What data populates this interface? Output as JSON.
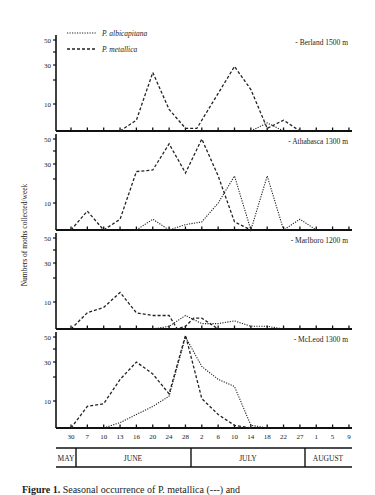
{
  "chart_data": {
    "type": "line",
    "ylabel": "Numbers of moths collected/week",
    "y_ticks": [
      10,
      30,
      50
    ],
    "y_minor_ticks": [
      20,
      40
    ],
    "ylim": [
      0,
      50
    ],
    "x_tick_labels": [
      "30",
      "7",
      "10",
      "13",
      "16",
      "20",
      "24",
      "28",
      "2",
      "6",
      "10",
      "14",
      "18",
      "22",
      "27",
      "1",
      "5",
      "9"
    ],
    "months": [
      {
        "label": "MAY",
        "start": 0,
        "end": 0.3
      },
      {
        "label": "JUNE",
        "start": 0.3,
        "end": 7.5
      },
      {
        "label": "JULY",
        "start": 7.5,
        "end": 14.5
      },
      {
        "label": "AUGUST",
        "start": 14.5,
        "end": 17.5
      }
    ],
    "legend": [
      {
        "name": "P. albicapitana",
        "style": "dotted"
      },
      {
        "name": "P. metallica",
        "style": "dashed"
      }
    ],
    "panels": [
      {
        "label": "- Berland 1500 m",
        "series": [
          {
            "name": "P. albicapitana",
            "points": [
              [
                11,
                0
              ],
              [
                12,
                3
              ],
              [
                13,
                0
              ]
            ]
          },
          {
            "name": "P. metallica",
            "points": [
              [
                3,
                0
              ],
              [
                4,
                4
              ],
              [
                5,
                25
              ],
              [
                6,
                8
              ],
              [
                7,
                1
              ],
              [
                7.7,
                1
              ],
              [
                10,
                29
              ],
              [
                11,
                16
              ],
              [
                12,
                1
              ],
              [
                13,
                4
              ],
              [
                14,
                0
              ]
            ]
          }
        ]
      },
      {
        "label": "- Athabasca 1300 m",
        "series": [
          {
            "name": "P. albicapitana",
            "points": [
              [
                4,
                0
              ],
              [
                5,
                4
              ],
              [
                6,
                0
              ],
              [
                7,
                2
              ],
              [
                8,
                3
              ],
              [
                9,
                10
              ],
              [
                10,
                22
              ],
              [
                11,
                0
              ],
              [
                12,
                22
              ],
              [
                13,
                0
              ],
              [
                14,
                4
              ],
              [
                15,
                0
              ]
            ]
          },
          {
            "name": "P. metallica",
            "points": [
              [
                0,
                0
              ],
              [
                1,
                7
              ],
              [
                2,
                0
              ],
              [
                3,
                4
              ],
              [
                4,
                25
              ],
              [
                5,
                26
              ],
              [
                6,
                46
              ],
              [
                7,
                24
              ],
              [
                8,
                50
              ],
              [
                9,
                22
              ],
              [
                10,
                3
              ],
              [
                11,
                0
              ]
            ]
          }
        ]
      },
      {
        "label": "- Marlboro 1200 m",
        "series": [
          {
            "name": "P. albicapitana",
            "points": [
              [
                5,
                0
              ],
              [
                6,
                1
              ],
              [
                7,
                5
              ],
              [
                8,
                2
              ],
              [
                8.7,
                2
              ],
              [
                9,
                2
              ],
              [
                10,
                3
              ],
              [
                11,
                1
              ],
              [
                12,
                1
              ],
              [
                13,
                0
              ],
              [
                14,
                0
              ]
            ]
          },
          {
            "name": "P. metallica",
            "points": [
              [
                0,
                0
              ],
              [
                1,
                6
              ],
              [
                2,
                8
              ],
              [
                3,
                14
              ],
              [
                4,
                6
              ],
              [
                5,
                5
              ],
              [
                6,
                5
              ],
              [
                6.5,
                0
              ],
              [
                7,
                1
              ],
              [
                7.5,
                4
              ],
              [
                8,
                4
              ],
              [
                9,
                0
              ]
            ]
          }
        ]
      },
      {
        "label": "- McLeod 1300 m",
        "series": [
          {
            "name": "P. albicapitana",
            "points": [
              [
                2,
                0
              ],
              [
                3,
                2
              ],
              [
                4,
                5
              ],
              [
                5,
                8
              ],
              [
                6,
                12
              ],
              [
                7,
                50
              ],
              [
                8,
                27
              ],
              [
                9,
                19
              ],
              [
                10,
                16
              ],
              [
                11,
                1
              ],
              [
                12,
                0
              ]
            ]
          },
          {
            "name": "P. metallica",
            "points": [
              [
                0,
                0
              ],
              [
                1,
                8
              ],
              [
                2,
                9
              ],
              [
                3,
                19
              ],
              [
                4,
                30
              ],
              [
                5,
                22
              ],
              [
                6,
                13
              ],
              [
                7,
                52
              ],
              [
                8,
                11
              ],
              [
                9,
                5
              ],
              [
                10,
                1
              ],
              [
                11,
                0
              ]
            ]
          }
        ]
      }
    ]
  },
  "caption": {
    "prefix": "Figure 1.",
    "text": " Seasonal occurrence of P. metallica (---) and"
  }
}
